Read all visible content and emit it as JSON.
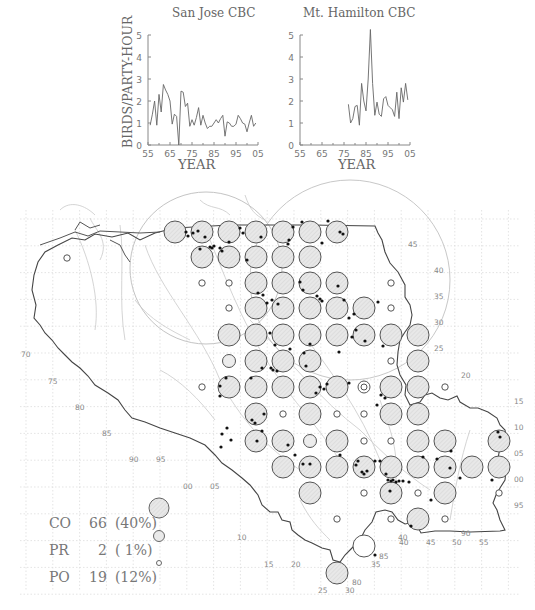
{
  "chart_data": [
    {
      "type": "line",
      "title": "San Jose CBC",
      "xlabel": "YEAR",
      "ylabel": "BIRDS/PARTY-HOUR",
      "xlim": [
        1955,
        2005
      ],
      "ylim": [
        0,
        5
      ],
      "x_ticks": [
        "55",
        "65",
        "75",
        "85",
        "95",
        "05"
      ],
      "y_ticks": [
        "0",
        "1",
        "2",
        "3",
        "4",
        "5"
      ],
      "x": [
        1956,
        1957,
        1958,
        1959,
        1960,
        1961,
        1962,
        1963,
        1964,
        1965,
        1966,
        1967,
        1968,
        1969,
        1970,
        1971,
        1972,
        1973,
        1974,
        1975,
        1976,
        1977,
        1978,
        1979,
        1980,
        1981,
        1982,
        1983,
        1984,
        1985,
        1986,
        1987,
        1988,
        1989,
        1990,
        1991,
        1992,
        1993,
        1994,
        1995,
        1996,
        1997,
        1998,
        1999,
        2000,
        2001,
        2002,
        2003,
        2004
      ],
      "values": [
        0.9,
        1.4,
        2.0,
        0.9,
        2.3,
        1.5,
        2.75,
        2.5,
        2.3,
        2.0,
        0.95,
        1.4,
        1.3,
        0.0,
        2.45,
        2.4,
        1.75,
        1.9,
        0.85,
        1.15,
        0.9,
        1.25,
        1.7,
        0.9,
        1.35,
        1.0,
        0.75,
        0.85,
        0.85,
        1.0,
        1.15,
        1.0,
        1.2,
        1.35,
        0.4,
        1.05,
        1.0,
        0.85,
        0.85,
        0.95,
        1.35,
        1.2,
        1.0,
        0.95,
        0.6,
        1.0,
        1.35,
        0.85,
        1.0
      ],
      "grid": false
    },
    {
      "type": "line",
      "title": "Mt. Hamilton CBC",
      "xlabel": "YEAR",
      "ylabel": "",
      "xlim": [
        1955,
        2005
      ],
      "ylim": [
        0,
        5
      ],
      "x_ticks": [
        "55",
        "65",
        "75",
        "85",
        "95",
        "05"
      ],
      "y_ticks": [
        "0",
        "1",
        "2",
        "3",
        "4",
        "5"
      ],
      "x": [
        1977,
        1978,
        1979,
        1980,
        1981,
        1982,
        1983,
        1984,
        1985,
        1986,
        1987,
        1988,
        1989,
        1990,
        1991,
        1992,
        1993,
        1994,
        1995,
        1996,
        1997,
        1998,
        1999,
        2000,
        2001,
        2002,
        2003,
        2004
      ],
      "values": [
        1.85,
        1.0,
        1.2,
        1.75,
        1.8,
        0.9,
        2.8,
        2.0,
        1.55,
        3.0,
        5.25,
        2.8,
        1.35,
        1.95,
        1.4,
        1.3,
        2.1,
        2.2,
        1.8,
        1.7,
        1.6,
        1.3,
        2.4,
        1.2,
        2.6,
        1.95,
        2.8,
        2.05
      ],
      "grid": false
    },
    {
      "type": "scatter",
      "title": "Breeding atlas map",
      "legend": [
        {
          "code": "CO",
          "count": 66,
          "percent": "(40%)",
          "symbol": "large-filled-circle"
        },
        {
          "code": "PR",
          "count": 2,
          "percent": "( 1%)",
          "symbol": "medium-circle"
        },
        {
          "code": "PO",
          "count": 19,
          "percent": "(12%)",
          "symbol": "small-circle"
        }
      ]
    }
  ],
  "charts": {
    "left": {
      "title": "San Jose CBC",
      "xlabel": "YEAR",
      "ylabel": "BIRDS/PARTY-HOUR"
    },
    "right": {
      "title": "Mt. Hamilton CBC",
      "xlabel": "YEAR"
    },
    "x_tick_labels": [
      "55",
      "65",
      "75",
      "85",
      "95",
      "05"
    ],
    "y_tick_labels": [
      "0",
      "1",
      "2",
      "3",
      "4",
      "5"
    ]
  },
  "map": {
    "colors": {
      "fill": "#e4e4e4",
      "stroke": "#555555",
      "dot": "#111111",
      "grid": "#d8d8d8",
      "rivers": "#c8c8c8",
      "coast": "#444444"
    },
    "columns_x": [
      175,
      202,
      229,
      256,
      283,
      310,
      337,
      364,
      391,
      418,
      445,
      472,
      499
    ],
    "rows_y": [
      232,
      257,
      283,
      308,
      335,
      361,
      387,
      414,
      441,
      467,
      493,
      519,
      546,
      573
    ],
    "cells": [
      {
        "r": 0,
        "c": 0,
        "t": "CO"
      },
      {
        "r": 0,
        "c": 1,
        "t": "CO"
      },
      {
        "r": 0,
        "c": 2,
        "t": "CO"
      },
      {
        "r": 0,
        "c": 3,
        "t": "CO"
      },
      {
        "r": 0,
        "c": 4,
        "t": "CO"
      },
      {
        "r": 0,
        "c": 5,
        "t": "CO"
      },
      {
        "r": 0,
        "c": 6,
        "t": "CO"
      },
      {
        "r": 1,
        "c": 1,
        "t": "CO"
      },
      {
        "r": 1,
        "c": 2,
        "t": "CO"
      },
      {
        "r": 1,
        "c": 3,
        "t": "CO"
      },
      {
        "r": 1,
        "c": 4,
        "t": "CO"
      },
      {
        "r": 1,
        "c": 5,
        "t": "CO"
      },
      {
        "r": 2,
        "c": 1,
        "t": "PO"
      },
      {
        "r": 2,
        "c": 2,
        "t": "PO"
      },
      {
        "r": 2,
        "c": 3,
        "t": "CO"
      },
      {
        "r": 2,
        "c": 4,
        "t": "CO"
      },
      {
        "r": 2,
        "c": 5,
        "t": "CO"
      },
      {
        "r": 2,
        "c": 6,
        "t": "CO"
      },
      {
        "r": 2,
        "c": 8,
        "t": "PO"
      },
      {
        "r": 3,
        "c": 2,
        "t": "PO"
      },
      {
        "r": 3,
        "c": 3,
        "t": "CO"
      },
      {
        "r": 3,
        "c": 4,
        "t": "CO"
      },
      {
        "r": 3,
        "c": 5,
        "t": "CO"
      },
      {
        "r": 3,
        "c": 6,
        "t": "CO"
      },
      {
        "r": 3,
        "c": 7,
        "t": "CO"
      },
      {
        "r": 3,
        "c": 8,
        "t": "PO"
      },
      {
        "r": 4,
        "c": 2,
        "t": "CO"
      },
      {
        "r": 4,
        "c": 3,
        "t": "CO"
      },
      {
        "r": 4,
        "c": 4,
        "t": "CO"
      },
      {
        "r": 4,
        "c": 5,
        "t": "CO"
      },
      {
        "r": 4,
        "c": 6,
        "t": "CO"
      },
      {
        "r": 4,
        "c": 7,
        "t": "CO"
      },
      {
        "r": 4,
        "c": 8,
        "t": "CO"
      },
      {
        "r": 4,
        "c": 9,
        "t": "CO"
      },
      {
        "r": 5,
        "c": 2,
        "t": "PR"
      },
      {
        "r": 5,
        "c": 3,
        "t": "CO"
      },
      {
        "r": 5,
        "c": 4,
        "t": "CO"
      },
      {
        "r": 5,
        "c": 5,
        "t": "CO"
      },
      {
        "r": 5,
        "c": 8,
        "t": "PO"
      },
      {
        "r": 5,
        "c": 9,
        "t": "CO"
      },
      {
        "r": 6,
        "c": 1,
        "t": "PO"
      },
      {
        "r": 6,
        "c": 2,
        "t": "CO"
      },
      {
        "r": 6,
        "c": 3,
        "t": "CO"
      },
      {
        "r": 6,
        "c": 4,
        "t": "CO"
      },
      {
        "r": 6,
        "c": 5,
        "t": "CO"
      },
      {
        "r": 6,
        "c": 6,
        "t": "CO"
      },
      {
        "r": 6,
        "c": 7,
        "t": "PR2"
      },
      {
        "r": 6,
        "c": 8,
        "t": "CO"
      },
      {
        "r": 6,
        "c": 9,
        "t": "CO"
      },
      {
        "r": 6,
        "c": 10,
        "t": "PO"
      },
      {
        "r": 7,
        "c": 3,
        "t": "CO"
      },
      {
        "r": 7,
        "c": 4,
        "t": "PO"
      },
      {
        "r": 7,
        "c": 5,
        "t": "CO"
      },
      {
        "r": 7,
        "c": 6,
        "t": "PO"
      },
      {
        "r": 7,
        "c": 7,
        "t": "PO"
      },
      {
        "r": 7,
        "c": 8,
        "t": "CO"
      },
      {
        "r": 7,
        "c": 9,
        "t": "CO"
      },
      {
        "r": 8,
        "c": 3,
        "t": "CO"
      },
      {
        "r": 8,
        "c": 4,
        "t": "CO"
      },
      {
        "r": 8,
        "c": 5,
        "t": "PR"
      },
      {
        "r": 8,
        "c": 6,
        "t": "CO"
      },
      {
        "r": 8,
        "c": 7,
        "t": "PO"
      },
      {
        "r": 8,
        "c": 8,
        "t": "PO"
      },
      {
        "r": 8,
        "c": 9,
        "t": "CO"
      },
      {
        "r": 8,
        "c": 10,
        "t": "CO"
      },
      {
        "r": 8,
        "c": 12,
        "t": "CO"
      },
      {
        "r": 9,
        "c": 4,
        "t": "CO"
      },
      {
        "r": 9,
        "c": 5,
        "t": "CO"
      },
      {
        "r": 9,
        "c": 6,
        "t": "CO"
      },
      {
        "r": 9,
        "c": 7,
        "t": "CO"
      },
      {
        "r": 9,
        "c": 8,
        "t": "CO"
      },
      {
        "r": 9,
        "c": 9,
        "t": "CO"
      },
      {
        "r": 9,
        "c": 10,
        "t": "CO"
      },
      {
        "r": 9,
        "c": 11,
        "t": "CO"
      },
      {
        "r": 9,
        "c": 12,
        "t": "CO"
      },
      {
        "r": 10,
        "c": 5,
        "t": "CO"
      },
      {
        "r": 10,
        "c": 7,
        "t": "PO"
      },
      {
        "r": 10,
        "c": 8,
        "t": "CO"
      },
      {
        "r": 10,
        "c": 9,
        "t": "PO"
      },
      {
        "r": 10,
        "c": 10,
        "t": "CO"
      },
      {
        "r": 10,
        "c": 12,
        "t": "PO"
      },
      {
        "r": 11,
        "c": 6,
        "t": "PO"
      },
      {
        "r": 11,
        "c": 8,
        "t": "PO"
      },
      {
        "r": 11,
        "c": 9,
        "t": "CO"
      },
      {
        "r": 11,
        "c": 10,
        "t": "PO"
      },
      {
        "r": 12,
        "c": 7,
        "t": "OPEN"
      },
      {
        "r": 13,
        "c": 6,
        "t": "CO"
      }
    ],
    "extra_po": [
      {
        "x": 67,
        "y": 258
      }
    ],
    "grid_labels": [
      {
        "t": "45",
        "x": 408,
        "y": 247
      },
      {
        "t": "40",
        "x": 434,
        "y": 273
      },
      {
        "t": "35",
        "x": 434,
        "y": 299
      },
      {
        "t": "30",
        "x": 434,
        "y": 325
      },
      {
        "t": "25",
        "x": 434,
        "y": 351
      },
      {
        "t": "20",
        "x": 461,
        "y": 378
      },
      {
        "t": "15",
        "x": 514,
        "y": 404
      },
      {
        "t": "10",
        "x": 514,
        "y": 430
      },
      {
        "t": "05",
        "x": 514,
        "y": 456
      },
      {
        "t": "00",
        "x": 514,
        "y": 482
      },
      {
        "t": "95",
        "x": 514,
        "y": 508
      },
      {
        "t": "90",
        "x": 461,
        "y": 536
      },
      {
        "t": "40",
        "x": 399,
        "y": 545
      },
      {
        "t": "45",
        "x": 426,
        "y": 545
      },
      {
        "t": "50",
        "x": 452,
        "y": 545
      },
      {
        "t": "55",
        "x": 479,
        "y": 545
      },
      {
        "t": "70",
        "x": 21,
        "y": 357
      },
      {
        "t": "75",
        "x": 48,
        "y": 384
      },
      {
        "t": "80",
        "x": 75,
        "y": 410
      },
      {
        "t": "85",
        "x": 102,
        "y": 436
      },
      {
        "t": "90",
        "x": 129,
        "y": 462
      },
      {
        "t": "95",
        "x": 156,
        "y": 462
      },
      {
        "t": "00",
        "x": 183,
        "y": 489
      },
      {
        "t": "05",
        "x": 210,
        "y": 489
      },
      {
        "t": "10",
        "x": 237,
        "y": 540
      },
      {
        "t": "15",
        "x": 264,
        "y": 567
      },
      {
        "t": "20",
        "x": 291,
        "y": 567
      },
      {
        "t": "25",
        "x": 318,
        "y": 593
      },
      {
        "t": "30",
        "x": 345,
        "y": 593
      },
      {
        "t": "80",
        "x": 352,
        "y": 585
      },
      {
        "t": "35",
        "x": 371,
        "y": 567
      },
      {
        "t": "85",
        "x": 379,
        "y": 559
      },
      {
        "t": "40",
        "x": 398,
        "y": 540
      }
    ]
  },
  "legend": {
    "rows": [
      {
        "code": "CO",
        "count": "66",
        "percent": "(40%)"
      },
      {
        "code": "PR",
        "count": "2",
        "percent": "( 1%)"
      },
      {
        "code": "PO",
        "count": "19",
        "percent": "(12%)"
      }
    ]
  }
}
